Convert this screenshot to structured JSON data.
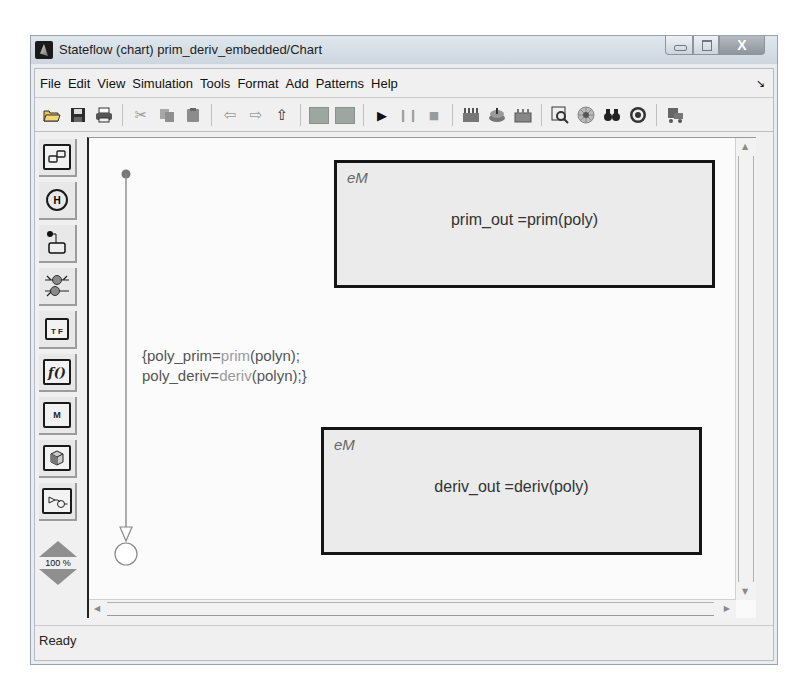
{
  "window": {
    "title": "Stateflow (chart) prim_deriv_embedded/Chart",
    "controls": {
      "close_label": "X"
    }
  },
  "menubar": {
    "items": [
      "File",
      "Edit",
      "View",
      "Simulation",
      "Tools",
      "Format",
      "Add",
      "Patterns",
      "Help"
    ],
    "corner_icon": "dock-arrow-icon"
  },
  "toolbar": {
    "groups": [
      [
        "open-icon",
        "save-icon",
        "print-icon"
      ],
      [
        "cut-icon",
        "copy-icon",
        "paste-icon"
      ],
      [
        "back-icon",
        "forward-icon",
        "up-icon"
      ],
      [
        "explorer-icon",
        "library-icon"
      ],
      [
        "start-icon",
        "pause-icon",
        "stop-icon"
      ],
      [
        "build-icon",
        "rebuild-icon",
        "incremental-build-icon"
      ],
      [
        "model-explorer-icon",
        "debugger-icon",
        "find-icon",
        "target-icon"
      ],
      [
        "open-simulink-icon"
      ]
    ]
  },
  "palette": {
    "tools": [
      "state-tool",
      "history-junction-tool",
      "default-transition-tool",
      "connective-junction-tool",
      "truth-table-tool",
      "graphical-function-tool",
      "matlab-function-tool",
      "box-tool",
      "simulink-function-tool"
    ],
    "tool_glyphs": {
      "history": "H",
      "truth_table": "T F",
      "function": "f()",
      "matlab": "M"
    },
    "zoom": {
      "level": "100 %",
      "in_label": "z",
      "out_label": "z"
    }
  },
  "chart": {
    "states": [
      {
        "tag": "eM",
        "body": "prim_out =prim(poly)"
      },
      {
        "tag": "eM",
        "body": "deriv_out =deriv(poly)"
      }
    ],
    "transition_label": {
      "line1_a": "{poly_prim=",
      "line1_fn": "prim",
      "line1_b": "(polyn);",
      "line2_a": "poly_deriv=",
      "line2_fn": "deriv",
      "line2_b": "(polyn);}"
    }
  },
  "status": {
    "text": "Ready"
  }
}
